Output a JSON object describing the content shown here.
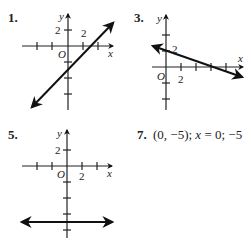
{
  "exercises": [
    {
      "number": "1.",
      "type": "graph",
      "axis_labels": {
        "x": "x",
        "y": "y",
        "origin": "O"
      },
      "tick_labels": {
        "x": "2",
        "y": "2"
      },
      "description": "Line with positive slope crossing y-axis below origin and x-axis to the right of 2"
    },
    {
      "number": "3.",
      "type": "graph",
      "axis_labels": {
        "x": "x",
        "y": "y",
        "origin": "O"
      },
      "tick_labels": {
        "x": "2",
        "y": "2"
      },
      "description": "Line with negative slope crossing y-axis near 2"
    },
    {
      "number": "5.",
      "type": "graph",
      "axis_labels": {
        "x": "x",
        "y": "y",
        "origin": "O"
      },
      "tick_labels": {
        "x": "2",
        "y": "2"
      },
      "description": "Horizontal line at y = -5"
    },
    {
      "number": "7.",
      "type": "text",
      "answer_parts": [
        "(0, −5); ",
        "x",
        " = 0; −5"
      ]
    }
  ]
}
